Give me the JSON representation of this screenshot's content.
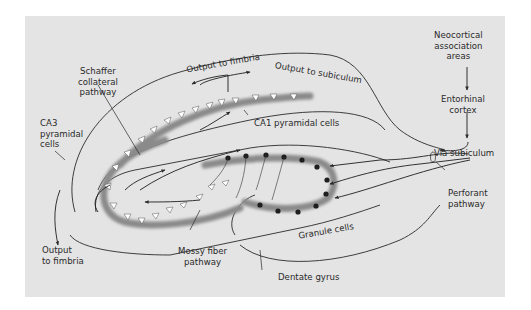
{
  "figure": {
    "colors": {
      "panel_background": "#e4e4e4",
      "page_background": "#ffffff",
      "cell_layer": "#8a8a8a",
      "pyramidal_cell": "#ffffff",
      "granule_cell": "#1e1e1e",
      "line": "#2a2a2a"
    }
  },
  "labels": {
    "neocortical": [
      "Neocortical",
      "association",
      "areas"
    ],
    "entorhinal": [
      "Entorhinal",
      "cortex"
    ],
    "via_subiculum": "Via subiculum",
    "perforant": [
      "Perforant",
      "pathway"
    ],
    "output_to_fimbria_top": "Output to fimbria",
    "output_to_subiculum": "Output to subiculum",
    "schaffer": [
      "Schaffer",
      "collateral",
      "pathway"
    ],
    "ca3": [
      "CA3",
      "pyramidal",
      "cells"
    ],
    "ca1": "CA1 pyramidal cells",
    "output_to_fimbria_bottom": [
      "Output",
      "to fimbria"
    ],
    "mossy": [
      "Mossy fiber",
      "pathway"
    ],
    "granule": "Granule cells",
    "dentate": "Dentate gyrus"
  }
}
